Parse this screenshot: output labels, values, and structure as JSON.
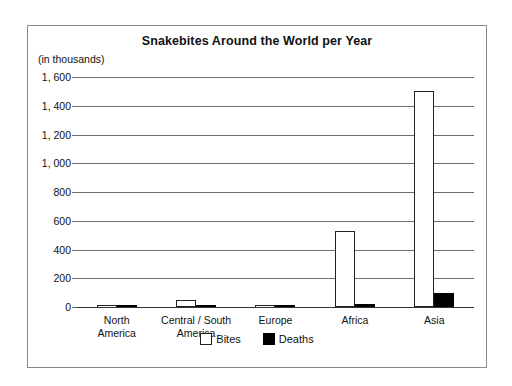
{
  "chart_data": {
    "type": "bar",
    "title": "Snakebites Around the World per Year",
    "units_caption": "(in thousands)",
    "xlabel": "",
    "ylabel": "",
    "ylim": [
      0,
      1600
    ],
    "ytick_step": 200,
    "ytick_labels": [
      "1, 600",
      "1, 400",
      "1, 200",
      "1, 000",
      "800",
      "600",
      "400",
      "200",
      "0"
    ],
    "ytick_values": [
      1600,
      1400,
      1200,
      1000,
      800,
      600,
      400,
      200,
      0
    ],
    "grid": true,
    "legend_position": "bottom",
    "categories": [
      "North\nAmerica",
      "Central / South\nAmerica",
      "Europe",
      "Africa",
      "Asia"
    ],
    "series": [
      {
        "name": "Bites",
        "color": "#ffffff",
        "values": [
          8,
          50,
          8,
          530,
          1500
        ]
      },
      {
        "name": "Deaths",
        "color": "#000000",
        "values": [
          1,
          2,
          1,
          20,
          95
        ]
      }
    ]
  },
  "legend": {
    "items": [
      {
        "label": "Bites",
        "swatch": "white-square-icon"
      },
      {
        "label": "Deaths",
        "swatch": "black-square-icon"
      }
    ]
  }
}
